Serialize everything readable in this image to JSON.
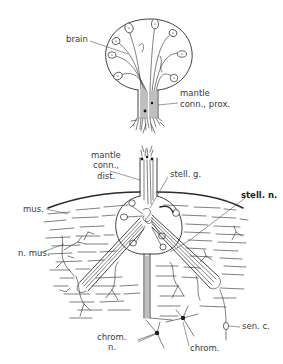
{
  "figure": {
    "colors": {
      "ink": "#2a2a2a",
      "background": "#ffffff",
      "label": "#3a3a3a"
    }
  },
  "labels": {
    "brain": "brain",
    "mantle_conn_prox_1": "mantle",
    "mantle_conn_prox_2": "conn., prox.",
    "mantle_conn_dist_1": "mantle",
    "mantle_conn_dist_2": "conn.,",
    "mantle_conn_dist_3": "dist.",
    "stell_g": "stell. g.",
    "stell_n": "stell. n.",
    "mus": "mus.",
    "n_mus": "n. mus.",
    "chrom_n_1": "chrom.",
    "chrom_n_2": "n.",
    "chrom": "chrom.",
    "sen_c": "sen. c."
  }
}
